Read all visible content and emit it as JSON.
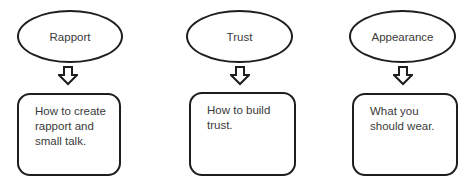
{
  "diagram": {
    "type": "flowchart",
    "columns": [
      {
        "heading": "Rapport",
        "lines": [
          "How to create",
          "rapport and",
          "small talk."
        ]
      },
      {
        "heading": "Trust",
        "lines": [
          "How to build",
          "trust."
        ]
      },
      {
        "heading": "Appearance",
        "lines": [
          "What you",
          "should wear."
        ]
      }
    ],
    "connector": "down-arrow-outline",
    "colors": {
      "stroke": "#1e1e1e",
      "text": "#3a3a3a",
      "background": "#ffffff"
    }
  }
}
